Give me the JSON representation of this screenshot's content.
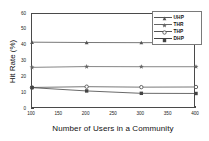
{
  "chart_data": {
    "type": "line",
    "title": "",
    "xlabel": "Number of Users in a Community",
    "ylabel": "Hit Rate (%)",
    "x": [
      100,
      200,
      300,
      400
    ],
    "xlim": [
      100,
      400
    ],
    "ylim": [
      0,
      60
    ],
    "xticks": [
      100,
      150,
      200,
      250,
      300,
      350,
      400
    ],
    "yticks": [
      0,
      10,
      20,
      30,
      40,
      50,
      60
    ],
    "grid": false,
    "legend_position": "top-right",
    "series": [
      {
        "name": "UHP",
        "marker": "triangle-up",
        "color": "#555555",
        "values": [
          42.2,
          42.0,
          41.9,
          42.0
        ]
      },
      {
        "name": "THR",
        "marker": "star",
        "color": "#666666",
        "values": [
          26.3,
          26.8,
          26.7,
          26.7
        ]
      },
      {
        "name": "THP",
        "marker": "circle",
        "color": "#555555",
        "values": [
          13.6,
          14.1,
          13.8,
          13.9
        ]
      },
      {
        "name": "DHP",
        "marker": "square",
        "color": "#444444",
        "values": [
          13.5,
          11.4,
          9.9,
          9.8
        ]
      }
    ]
  }
}
